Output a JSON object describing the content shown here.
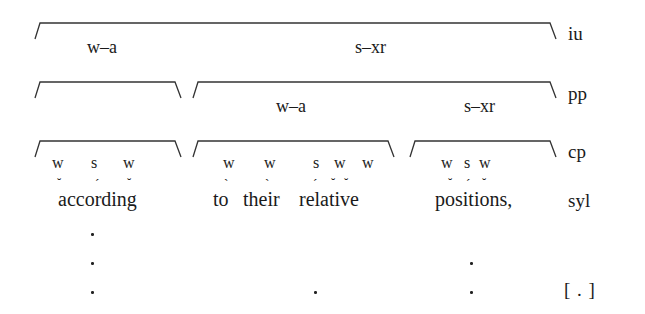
{
  "diagram": {
    "tiers": [
      {
        "id": "iu",
        "label": "iu"
      },
      {
        "id": "pp",
        "label": "pp"
      },
      {
        "id": "cp",
        "label": "cp"
      },
      {
        "id": "syl",
        "label": "syl"
      },
      {
        "id": "grid",
        "label": "[ . ]"
      }
    ],
    "iu": {
      "constituents": [
        {
          "label": "w–a"
        },
        {
          "label": "s–xr"
        }
      ]
    },
    "pp": {
      "constituents": [
        {
          "label": "w–a"
        },
        {
          "label": "s–xr"
        }
      ]
    },
    "cp": {
      "groups": [
        {
          "weights": [
            "w",
            "s",
            "w"
          ],
          "text": "according",
          "marks": [
            "˘",
            "ˊ",
            "˘"
          ]
        },
        {
          "weights": [
            "w",
            "w",
            "s",
            "w",
            "w"
          ],
          "text": "to their relative",
          "marks": [
            "ˋ",
            "ˋ",
            "ˊ",
            "˘",
            "˘"
          ]
        },
        {
          "weights": [
            "w",
            "s",
            "w"
          ],
          "text": "positions,",
          "marks": [
            "˘",
            "ˊ",
            "˘"
          ]
        }
      ]
    },
    "syl": {
      "words": [
        "according",
        "to",
        "their",
        "relative",
        "positions,"
      ]
    },
    "grid_dots": {
      "columns": [
        {
          "x_word": "according",
          "count": 3
        },
        {
          "x_word": "relative",
          "count": 1
        },
        {
          "x_word": "positions,",
          "count": 2
        }
      ]
    },
    "colors": {
      "ink": "#1a1a1a",
      "background": "#ffffff"
    }
  }
}
